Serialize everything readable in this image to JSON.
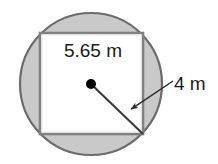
{
  "figure": {
    "type": "geometry-diagram",
    "canvas": {
      "width": 218,
      "height": 164,
      "background": "#ffffff"
    },
    "colors": {
      "circle_fill": "#c9c9c9",
      "circle_stroke": "#6b6b6b",
      "square_fill": "#ffffff",
      "square_stroke": "#808080",
      "square_inner_stroke": "#5a5a5a",
      "line": "#3a3a3a",
      "dot": "#000000",
      "text": "#1a1a1a"
    },
    "circle": {
      "name": "outer-circle",
      "center_x": 91,
      "center_y": 84,
      "radius": 71
    },
    "square": {
      "name": "inscribed-square",
      "left": 40,
      "top": 33,
      "right": 143,
      "bottom": 134,
      "side_px": 103
    },
    "center_dot": {
      "name": "center-point",
      "x": 91,
      "y": 84,
      "radius": 5
    },
    "radius_line": {
      "name": "radius-segment",
      "x1": 91,
      "y1": 84,
      "x2": 143,
      "y2": 134
    },
    "leader_arrow": {
      "name": "radius-leader-arrow",
      "x1": 173,
      "y1": 81,
      "x2": 127,
      "y2": 112
    },
    "labels": {
      "side_length": {
        "name": "square-side-label",
        "text": "5.65 m",
        "x": 93,
        "y": 57,
        "anchor": "middle"
      },
      "radius_length": {
        "name": "circle-radius-label",
        "text": "4 m",
        "x": 174,
        "y": 90,
        "anchor": "start"
      }
    }
  },
  "chart_data": {
    "type": "diagram",
    "annotations": [
      {
        "label": "5.65 m",
        "refers_to": "square side length",
        "value": 5.65,
        "unit": "m"
      },
      {
        "label": "4 m",
        "refers_to": "circle radius",
        "value": 4,
        "unit": "m"
      }
    ],
    "shapes": [
      {
        "kind": "circle",
        "role": "outer",
        "fill": "gray",
        "radius_label": "4 m"
      },
      {
        "kind": "square",
        "role": "inscribed",
        "fill": "white",
        "side_label": "5.65 m"
      }
    ]
  }
}
